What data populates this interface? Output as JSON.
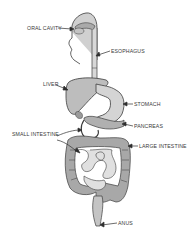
{
  "diagram": {
    "labels": {
      "oral_cavity": "ORAL CAVITY",
      "esophagus": "ESOPHAGUS",
      "liver": "LIVER",
      "stomach": "STOMACH",
      "pancreas": "PANCREAS",
      "small_intestine": "SMALL INTESTINE",
      "large_intestine": "LARGE INTESTINE",
      "anus": "ANUS"
    },
    "colors": {
      "organ_fill": "#bdbdbd",
      "organ_light": "#d6d6d6",
      "outline": "#3c3c3c",
      "text": "#3a3a3a"
    }
  }
}
